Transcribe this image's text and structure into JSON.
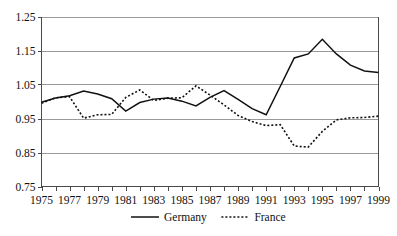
{
  "chart_data": {
    "type": "line",
    "title": "",
    "xlabel": "",
    "ylabel": "",
    "ylim": [
      0.75,
      1.25
    ],
    "xlim": [
      1975,
      1999
    ],
    "grid": true,
    "legend_position": "bottom",
    "y_ticks": [
      "1.25",
      "1.15",
      "1.05",
      "0.95",
      "0.85",
      "0.75"
    ],
    "y_tick_values": [
      1.25,
      1.15,
      1.05,
      0.95,
      0.85,
      0.75
    ],
    "x_tick_labels": [
      "1975",
      "1977",
      "1979",
      "1981",
      "1983",
      "1985",
      "1987",
      "1989",
      "1991",
      "1993",
      "1995",
      "1997",
      "1999"
    ],
    "x": [
      1975,
      1976,
      1977,
      1978,
      1979,
      1980,
      1981,
      1982,
      1983,
      1984,
      1985,
      1986,
      1987,
      1988,
      1989,
      1990,
      1991,
      1992,
      1993,
      1994,
      1995,
      1996,
      1997,
      1998,
      1999
    ],
    "series": [
      {
        "name": "Germany",
        "style": "solid",
        "color": "#111111",
        "values": [
          0.998,
          1.01,
          1.017,
          1.031,
          1.022,
          1.008,
          0.972,
          0.997,
          1.007,
          1.01,
          1.001,
          0.987,
          1.012,
          1.032,
          1.006,
          0.979,
          0.961,
          1.044,
          1.128,
          1.14,
          1.183,
          1.14,
          1.107,
          1.09,
          1.085
        ]
      },
      {
        "name": "France",
        "style": "dotted",
        "color": "#111111",
        "values": [
          0.995,
          1.011,
          1.014,
          0.951,
          0.961,
          0.962,
          1.012,
          1.034,
          1.003,
          1.01,
          1.011,
          1.046,
          1.019,
          0.99,
          0.959,
          0.941,
          0.929,
          0.932,
          0.869,
          0.866,
          0.912,
          0.946,
          0.952,
          0.953,
          0.957
        ]
      }
    ]
  },
  "legend": {
    "items": [
      {
        "label": "Germany",
        "style": "solid"
      },
      {
        "label": "France",
        "style": "dotted"
      }
    ]
  }
}
